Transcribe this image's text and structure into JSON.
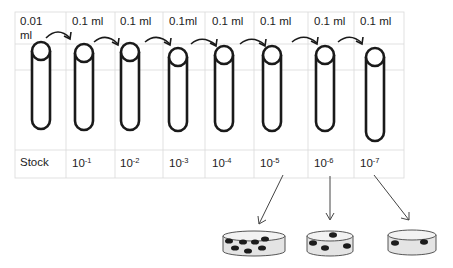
{
  "diagram": {
    "grid": {
      "left": 15,
      "top": 12,
      "right": 404,
      "bottom": 178,
      "row_lines": [
        44,
        70,
        150
      ],
      "col_lines": [
        66,
        115,
        163,
        205,
        254,
        308,
        354
      ],
      "line_color": "#d9d9d9"
    },
    "tubes": [
      {
        "cx": 41,
        "volume": "0.01 ml",
        "volume_line2": "",
        "label_base": "Stock",
        "label_exp": ""
      },
      {
        "cx": 84,
        "volume": "0.1 ml",
        "label_base": "10",
        "label_exp": "-1"
      },
      {
        "cx": 130,
        "volume": "0.1 ml",
        "label_base": "10",
        "label_exp": "-2"
      },
      {
        "cx": 178,
        "volume": "0.1ml",
        "label_base": "10",
        "label_exp": "-3"
      },
      {
        "cx": 224,
        "volume": "0.1 ml",
        "label_base": "10",
        "label_exp": "-4"
      },
      {
        "cx": 272,
        "volume": "0.1 ml",
        "label_base": "10",
        "label_exp": "-5"
      },
      {
        "cx": 325,
        "volume": "0.1 ml",
        "label_base": "10",
        "label_exp": "-6"
      },
      {
        "cx": 375,
        "volume": "0.1 ml",
        "label_base": "10",
        "label_exp": "-7"
      }
    ],
    "volumes": [
      "0.01",
      "ml",
      "0.1 ml",
      "0.1 ml",
      "0.1ml",
      "0.1 ml",
      "0.1 ml",
      "0.1 ml",
      "0.1 ml"
    ],
    "labels": {
      "stock": "Stock",
      "l1_base": "10",
      "l1_exp": "-1",
      "l2_base": "10",
      "l2_exp": "-2",
      "l3_base": "10",
      "l3_exp": "-3",
      "l4_base": "10",
      "l4_exp": "-4",
      "l5_base": "10",
      "l5_exp": "-5",
      "l6_base": "10",
      "l6_exp": "-6",
      "l7_base": "10",
      "l7_exp": "-7"
    },
    "plates": [
      {
        "name": "plate-10-5",
        "colonies": 7
      },
      {
        "name": "plate-10-6",
        "colonies": 4
      },
      {
        "name": "plate-10-7",
        "colonies": 2
      }
    ],
    "colors": {
      "stroke": "#1a1a1a",
      "grid": "#d9d9d9",
      "plate_fill": "#e4e4e4",
      "plate_rim": "#f2f2f2",
      "colony": "#1c1c1c",
      "arrow": "#444444"
    }
  }
}
